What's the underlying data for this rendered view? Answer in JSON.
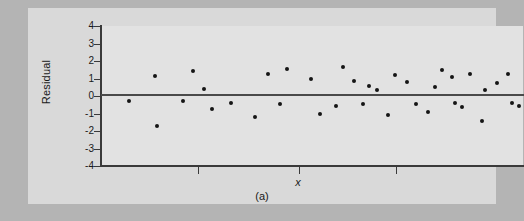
{
  "figure": {
    "caption": "(a)",
    "panel_background": "#d9d9d9",
    "plot_background": "#e2e2e2",
    "outer_background": "#b4b4b4",
    "axis_color": "#3a3a3a",
    "marker_color": "#151515"
  },
  "chart_data": {
    "type": "scatter",
    "title": "",
    "subtitle": "",
    "xlabel": "x",
    "ylabel": "Residual",
    "ylim": [
      -4,
      4
    ],
    "yticks": [
      4,
      3,
      2,
      1,
      0,
      -1,
      -2,
      -3,
      -4
    ],
    "ytick_labels": [
      "4",
      "3",
      "2",
      "1",
      "0",
      "-1",
      "-2",
      "-3",
      "-4"
    ],
    "xlim": [
      0,
      100
    ],
    "xticks": [
      23,
      47,
      70
    ],
    "xtick_labels": [
      "",
      "",
      ""
    ],
    "grid": false,
    "legend": null,
    "reference_lines": [
      {
        "orientation": "horizontal",
        "y": 0,
        "label": "zero residual line"
      }
    ],
    "annotations": [
      {
        "text": "(a)",
        "role": "figure-caption"
      }
    ],
    "series": [
      {
        "name": "Residuals",
        "marker": "circle",
        "points": [
          {
            "x": 6.6,
            "y": -0.3
          },
          {
            "x": 12.7,
            "y": 1.12
          },
          {
            "x": 13.2,
            "y": -1.72
          },
          {
            "x": 19.5,
            "y": -0.27
          },
          {
            "x": 21.7,
            "y": 1.42
          },
          {
            "x": 24.5,
            "y": 0.38
          },
          {
            "x": 26.2,
            "y": -0.77
          },
          {
            "x": 30.8,
            "y": -0.42
          },
          {
            "x": 36.5,
            "y": -1.18
          },
          {
            "x": 39.6,
            "y": 1.27
          },
          {
            "x": 42.4,
            "y": -0.48
          },
          {
            "x": 44.0,
            "y": 1.55
          },
          {
            "x": 49.8,
            "y": 0.97
          },
          {
            "x": 51.8,
            "y": -1.02
          },
          {
            "x": 55.6,
            "y": -0.55
          },
          {
            "x": 57.3,
            "y": 1.68
          },
          {
            "x": 60.0,
            "y": 0.88
          },
          {
            "x": 62.2,
            "y": -0.48
          },
          {
            "x": 63.4,
            "y": 0.6
          },
          {
            "x": 65.4,
            "y": 0.35
          },
          {
            "x": 68.0,
            "y": -1.1
          },
          {
            "x": 69.7,
            "y": 1.2
          },
          {
            "x": 72.5,
            "y": 0.82
          },
          {
            "x": 74.6,
            "y": -0.43
          },
          {
            "x": 77.4,
            "y": -0.9
          },
          {
            "x": 79.2,
            "y": 0.5
          },
          {
            "x": 80.8,
            "y": 1.47
          },
          {
            "x": 83.1,
            "y": 1.08
          },
          {
            "x": 84.0,
            "y": -0.38
          },
          {
            "x": 85.5,
            "y": -0.62
          },
          {
            "x": 87.4,
            "y": 1.25
          },
          {
            "x": 90.2,
            "y": -1.45
          },
          {
            "x": 91.0,
            "y": 0.32
          },
          {
            "x": 93.8,
            "y": 0.75
          },
          {
            "x": 96.4,
            "y": 1.28
          },
          {
            "x": 97.5,
            "y": -0.42
          },
          {
            "x": 99.0,
            "y": -0.55
          }
        ]
      }
    ]
  }
}
